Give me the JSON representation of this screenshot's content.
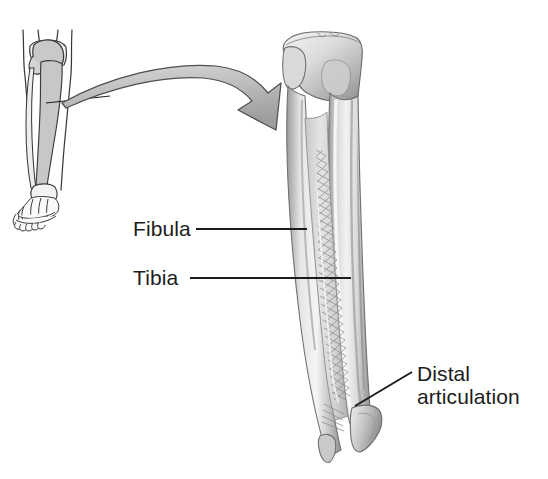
{
  "figure": {
    "background_color": "#ffffff",
    "ink_color": "#1c1c1c",
    "bone_light": "#efefef",
    "bone_mid": "#c9c9c9",
    "bone_shadow": "#8d8d8d",
    "bone_dark": "#6e6e6e",
    "arrow_fill": "#bdbdbd",
    "arrow_stroke": "#4a4a4a",
    "inset_tint": "#d2d2d2"
  },
  "labels": {
    "fibula": "Fibula",
    "tibia": "Tibia",
    "distal_line1": "Distal",
    "distal_line2": "articulation"
  },
  "parts": {
    "inset_leg": "lower-leg-skeleton-inset",
    "main_bone": "tibia-fibula-anterior",
    "interosseous_membrane": "interosseous-membrane",
    "proximal_end": "tibial-plateau",
    "distal_end": "ankle-malleoli",
    "magnify_arrow": "curved-magnify-arrow"
  }
}
